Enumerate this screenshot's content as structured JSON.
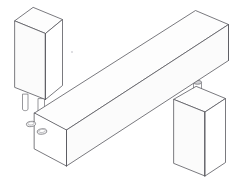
{
  "drawing": {
    "title": "Isometric dowel joint assembly",
    "subject": "two-post and beam dowel joinery exploded view",
    "projection": "isometric",
    "style": "line drawing, white fill, grey outlines",
    "canvas": {
      "width": 232,
      "height": 185,
      "background": "#ffffff"
    },
    "colors": {
      "outline": "#58585e",
      "outline_soft": "#8a8a90",
      "fill_white": "#ffffff",
      "fill_top": "#fdfdfd",
      "fill_side": "#fbfbfb",
      "dowel_outline": "#6a6a70",
      "dowel_cap": "#cfcfd2",
      "hole_fill": "#f2f2f2",
      "speck": "#d8d8dc"
    },
    "parts": [
      {
        "id": "upper-post",
        "label": "Upper vertical post",
        "role": "rectangular post suspended above the beam, left side",
        "has_dowels": true,
        "dowel_count": 2,
        "dowel_direction": "downward from post bottom"
      },
      {
        "id": "beam",
        "label": "Horizontal beam",
        "role": "long rectangular beam running lower-left to upper-right",
        "has_holes": true,
        "hole_count": 2,
        "hole_location": "top face near left end"
      },
      {
        "id": "lower-post",
        "label": "Lower vertical post",
        "role": "rectangular post standing below and behind the beam, right side",
        "has_dowels": true,
        "dowel_count": 1,
        "dowel_direction": "upward from post top"
      }
    ],
    "features": {
      "dowels": [
        {
          "id": "upper-dowel-left",
          "shape": "cylinder",
          "state": "protruding"
        },
        {
          "id": "upper-dowel-right",
          "shape": "cylinder",
          "state": "protruding"
        },
        {
          "id": "lower-dowel",
          "shape": "cylinder",
          "state": "protruding",
          "cap_shaded": true
        }
      ],
      "holes": [
        {
          "id": "beam-hole-rear",
          "shape": "ellipse",
          "state": "open"
        },
        {
          "id": "beam-hole-front",
          "shape": "ellipse",
          "state": "open"
        }
      ]
    }
  }
}
